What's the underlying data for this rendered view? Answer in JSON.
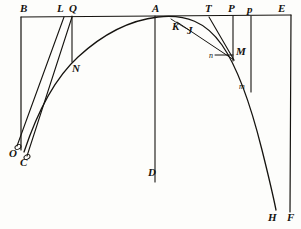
{
  "figure": {
    "ink_color": "#15130f",
    "paper_color": "#fdfdfb",
    "width": 301,
    "height": 229
  },
  "labels": [
    {
      "id": "B",
      "text": "B",
      "x": 20,
      "y": 3,
      "size": "cap"
    },
    {
      "id": "L",
      "text": "L",
      "x": 57,
      "y": 3,
      "size": "cap"
    },
    {
      "id": "Q",
      "text": "Q",
      "x": 69,
      "y": 3,
      "size": "cap"
    },
    {
      "id": "A",
      "text": "A",
      "x": 152,
      "y": 3,
      "size": "cap"
    },
    {
      "id": "T",
      "text": "T",
      "x": 205,
      "y": 3,
      "size": "cap"
    },
    {
      "id": "P",
      "text": "P",
      "x": 228,
      "y": 3,
      "size": "cap"
    },
    {
      "id": "p",
      "text": "p",
      "x": 247,
      "y": 4,
      "size": "cap"
    },
    {
      "id": "E",
      "text": "E",
      "x": 278,
      "y": 3,
      "size": "cap"
    },
    {
      "id": "K",
      "text": "K",
      "x": 172,
      "y": 21,
      "size": "cap"
    },
    {
      "id": "J",
      "text": "J",
      "x": 187,
      "y": 25,
      "size": "cap"
    },
    {
      "id": "N",
      "text": "N",
      "x": 72,
      "y": 63,
      "size": "cap"
    },
    {
      "id": "M",
      "text": "M",
      "x": 236,
      "y": 46,
      "size": "cap"
    },
    {
      "id": "n",
      "text": "n",
      "x": 209,
      "y": 52,
      "size": "small"
    },
    {
      "id": "m",
      "text": "m",
      "x": 239,
      "y": 83,
      "size": "small"
    },
    {
      "id": "O",
      "text": "O",
      "x": 9,
      "y": 148,
      "size": "cap"
    },
    {
      "id": "C",
      "text": "C",
      "x": 20,
      "y": 157,
      "size": "cap"
    },
    {
      "id": "D",
      "text": "D",
      "x": 148,
      "y": 167,
      "size": "cap"
    },
    {
      "id": "H",
      "text": "H",
      "x": 268,
      "y": 212,
      "size": "cap"
    },
    {
      "id": "F",
      "text": "F",
      "x": 287,
      "y": 212,
      "size": "cap"
    }
  ],
  "geometry": {
    "baseline": {
      "name": "top-baseline-BE",
      "x1": 21,
      "y1": 17,
      "x2": 291,
      "y2": 15
    },
    "verticals": [
      {
        "name": "vertical-B-to-C",
        "x1": 21,
        "y1": 17,
        "x2": 21,
        "y2": 150
      },
      {
        "name": "vertical-Q-to-N",
        "x1": 72,
        "y1": 16,
        "x2": 72,
        "y2": 62
      },
      {
        "name": "vertical-A-to-D",
        "x1": 155,
        "y1": 16,
        "x2": 155,
        "y2": 182
      },
      {
        "name": "vertical-P-to-M",
        "x1": 233,
        "y1": 16,
        "x2": 233,
        "y2": 60
      },
      {
        "name": "vertical-p-to-m",
        "x1": 251,
        "y1": 16,
        "x2": 251,
        "y2": 92
      },
      {
        "name": "vertical-E-to-F",
        "x1": 291,
        "y1": 15,
        "x2": 290,
        "y2": 212
      }
    ],
    "chords": [
      {
        "name": "chord-L-to-O",
        "x1": 64,
        "y1": 17,
        "x2": 17,
        "y2": 146
      },
      {
        "name": "chord-Q-to-C",
        "x1": 72,
        "y1": 17,
        "x2": 27,
        "y2": 156
      },
      {
        "name": "tangent-T-to-M",
        "x1": 209,
        "y1": 17,
        "x2": 234,
        "y2": 60
      },
      {
        "name": "secant-K-to-M",
        "x1": 176,
        "y1": 21,
        "x2": 234,
        "y2": 60
      },
      {
        "name": "normal-n-to-M",
        "x1": 215,
        "y1": 55,
        "x2": 233,
        "y2": 55
      }
    ],
    "curve": {
      "name": "main-curve-C-to-H",
      "path": "M 24,152 C 38,110 55,78 78,57 C 104,33 132,20 158,17 C 186,14 206,22 222,45 C 238,68 252,110 262,150 C 270,182 274,200 276,210"
    },
    "curve_secondary": {
      "name": "arc-segment-K-J",
      "path": "M 172,19 C 178,23 183,26 190,30"
    }
  }
}
